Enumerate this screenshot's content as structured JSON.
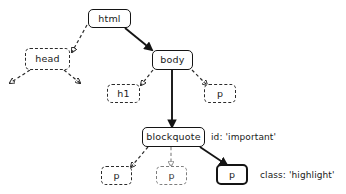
{
  "diagram": {
    "background_color": "#ffffff",
    "solid_stroke_color": "#141414",
    "dashed_stroke_color": "#2b2b2b",
    "faded_stroke_color": "#7d7d7d",
    "nodes": [
      {
        "id": "html",
        "label": "html",
        "style": "solid",
        "x": 88,
        "y": 9,
        "w": 43,
        "h": 19
      },
      {
        "id": "head",
        "label": "head",
        "style": "dashed",
        "x": 25,
        "y": 48,
        "w": 45,
        "h": 22
      },
      {
        "id": "body",
        "label": "body",
        "style": "solid",
        "x": 152,
        "y": 50,
        "w": 41,
        "h": 20
      },
      {
        "id": "h1",
        "label": "h1",
        "style": "dashed",
        "x": 107,
        "y": 84,
        "w": 33,
        "h": 19
      },
      {
        "id": "p_body",
        "label": "p",
        "style": "dashed",
        "x": 204,
        "y": 84,
        "w": 32,
        "h": 19
      },
      {
        "id": "blockquote",
        "label": "blockquote",
        "style": "solid",
        "x": 142,
        "y": 127,
        "w": 63,
        "h": 20
      },
      {
        "id": "p_bq_left",
        "label": "p",
        "style": "dashed",
        "x": 101,
        "y": 166,
        "w": 31,
        "h": 19
      },
      {
        "id": "p_bq_mid",
        "label": "p",
        "style": "dashed-light",
        "x": 156,
        "y": 166,
        "w": 31,
        "h": 19
      },
      {
        "id": "p_bq_right",
        "label": "p",
        "style": "solid-thick",
        "x": 216,
        "y": 164,
        "w": 32,
        "h": 21
      }
    ],
    "annotations": [
      {
        "id": "id-important",
        "text": "id: 'important'",
        "x": 211,
        "y": 132
      },
      {
        "id": "class-highlight",
        "text": "class: 'highlight'",
        "x": 260,
        "y": 170
      }
    ],
    "edges": [
      {
        "id": "html-head",
        "from": "html",
        "to": "head",
        "style": "dashed"
      },
      {
        "id": "html-body",
        "from": "html",
        "to": "body",
        "style": "solid"
      },
      {
        "id": "head-out-left",
        "from": "head",
        "to": "offscreen",
        "style": "dashed"
      },
      {
        "id": "head-out-right",
        "from": "head",
        "to": "offscreen",
        "style": "dashed"
      },
      {
        "id": "body-h1",
        "from": "body",
        "to": "h1",
        "style": "dashed"
      },
      {
        "id": "body-p",
        "from": "body",
        "to": "p_body",
        "style": "dashed"
      },
      {
        "id": "body-blockquote",
        "from": "body",
        "to": "blockquote",
        "style": "solid"
      },
      {
        "id": "blockquote-p-left",
        "from": "blockquote",
        "to": "p_bq_left",
        "style": "dashed"
      },
      {
        "id": "blockquote-p-mid",
        "from": "blockquote",
        "to": "p_bq_mid",
        "style": "dashed"
      },
      {
        "id": "blockquote-p-right",
        "from": "blockquote",
        "to": "p_bq_right",
        "style": "solid"
      }
    ]
  }
}
